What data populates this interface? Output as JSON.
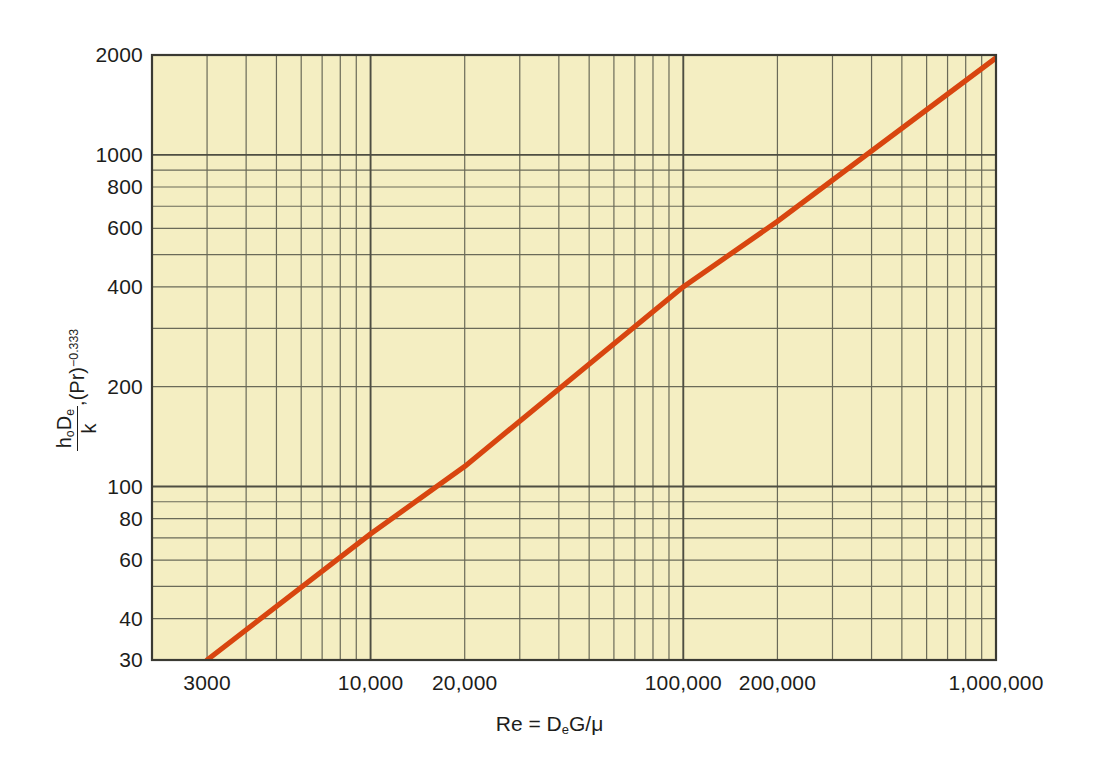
{
  "chart_data": {
    "type": "line",
    "title": "",
    "xlabel": "Re = DeG/μ",
    "ylabel": "hoDe/k · (Pr)^-0.333",
    "xscale": "log",
    "yscale": "log",
    "xlim": [
      2000,
      1000000
    ],
    "ylim": [
      30,
      2000
    ],
    "grid": true,
    "legend": "none",
    "x_tick_labels": [
      "3000",
      "10,000",
      "20,000",
      "100,000",
      "200,000",
      "1,000,000"
    ],
    "x_tick_values": [
      3000,
      10000,
      20000,
      100000,
      200000,
      1000000
    ],
    "y_tick_labels": [
      "30",
      "40",
      "60",
      "80",
      "100",
      "200",
      "400",
      "600",
      "800",
      "1000",
      "2000"
    ],
    "y_tick_values": [
      30,
      40,
      60,
      80,
      100,
      200,
      400,
      600,
      800,
      1000,
      2000
    ],
    "series": [
      {
        "name": "Nusselt correlation line",
        "color": "#d8450f",
        "x": [
          3000,
          10000,
          20000,
          100000,
          200000,
          1000000
        ],
        "y": [
          30,
          72,
          115,
          400,
          630,
          1960
        ]
      }
    ],
    "annotations": []
  },
  "axes": {
    "x_title": {
      "prefix": "Re = D",
      "sub1": "e",
      "mid": "G/",
      "greek": "μ"
    },
    "y_title": {
      "numerator_h": "h",
      "numerator_h_sub": "o",
      "numerator_d": "D",
      "numerator_d_sub": "e",
      "denominator": "k",
      "suffix_comma": ",(Pr)",
      "suffix_exp": "−0.333"
    }
  },
  "style": {
    "plot_background": "#f4eec2",
    "grid_major_color": "#4e4e42",
    "grid_minor_color": "#6a6a58",
    "axis_color": "#3a3a33",
    "line_color": "#d8450f",
    "text_color": "#1d1d1b",
    "page_background": "#ffffff"
  }
}
